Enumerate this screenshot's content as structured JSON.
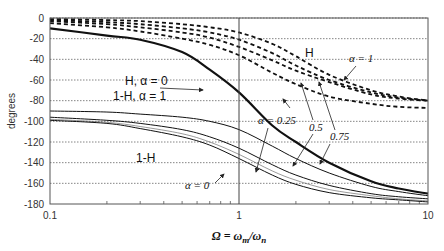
{
  "chart_data": {
    "type": "line",
    "title": "",
    "xlabel": "Ω = ω_m/ω_n",
    "ylabel": "degrees",
    "xscale": "log",
    "xlim": [
      0.1,
      10
    ],
    "ylim": [
      -180,
      0
    ],
    "x_ticks": [
      "0.1",
      "1",
      "10"
    ],
    "y_ticks": [
      "0",
      "-20",
      "-40",
      "-60",
      "-80",
      "-100",
      "-120",
      "-140",
      "-160",
      "-180"
    ],
    "grid": "horizontal dotted",
    "x": [
      0.1,
      0.2,
      0.3,
      0.5,
      0.7,
      1,
      1.5,
      2,
      3,
      5,
      7,
      10
    ],
    "series": [
      {
        "name": "H, α=1",
        "style": "dashed",
        "values": [
          -1,
          -2,
          -3,
          -6,
          -9,
          -14,
          -25,
          -37,
          -55,
          -70,
          -76,
          -80
        ]
      },
      {
        "name": "H, α=0.75",
        "style": "dashed",
        "values": [
          -2,
          -4,
          -6,
          -10,
          -14,
          -21,
          -34,
          -46,
          -60,
          -72,
          -77,
          -80
        ]
      },
      {
        "name": "H, α=0.5",
        "style": "dashed",
        "values": [
          -3,
          -6,
          -9,
          -14,
          -19,
          -28,
          -41,
          -51,
          -62,
          -74,
          -78,
          -80
        ]
      },
      {
        "name": "H, α=0.25",
        "style": "dashed",
        "values": [
          -5,
          -9,
          -13,
          -20,
          -26,
          -36,
          -53,
          -64,
          -76,
          -83,
          -86,
          -87
        ]
      },
      {
        "name": "H α=0 / 1-H α=1",
        "style": "thick solid",
        "values": [
          -10,
          -17,
          -21,
          -33,
          -50,
          -72,
          -104,
          -120,
          -140,
          -158,
          -165,
          -170
        ]
      },
      {
        "name": "1-H, α=0.75",
        "style": "solid",
        "values": [
          -90,
          -91,
          -93,
          -96,
          -100,
          -108,
          -124,
          -136,
          -150,
          -163,
          -168,
          -172
        ]
      },
      {
        "name": "1-H, α=0.5",
        "style": "solid",
        "values": [
          -96,
          -99,
          -102,
          -108,
          -115,
          -126,
          -142,
          -152,
          -162,
          -170,
          -173,
          -175
        ]
      },
      {
        "name": "1-H, α=0.25",
        "style": "solid thin",
        "values": [
          -98,
          -101,
          -105,
          -112,
          -120,
          -132,
          -148,
          -157,
          -166,
          -172,
          -175,
          -177
        ]
      },
      {
        "name": "1-H, α=0",
        "style": "solid",
        "values": [
          -99,
          -102,
          -107,
          -115,
          -123,
          -136,
          -152,
          -161,
          -169,
          -174,
          -176,
          -178
        ]
      }
    ],
    "annotations": [
      "H",
      "α = 1",
      "H,  α = 0",
      "1-H,  α = 1",
      "α = 0.25",
      "0.5",
      "0.75",
      "1-H",
      "α = 0"
    ]
  },
  "labels": {
    "ylabel": "degrees",
    "xlabel_main": "Ω = ω",
    "xlabel_sub1": "m",
    "xlabel_mid": "/ω",
    "xlabel_sub2": "n",
    "h_label": "H",
    "alpha1_label": "α = 1",
    "h_alpha0": "H,  α = 0",
    "oneminush_alpha1": "1-H,  α = 1",
    "alpha025": "α = 0.25",
    "a05": "0.5",
    "a075": "0.75",
    "oneminush": "1-H",
    "alpha0": "α = 0"
  }
}
